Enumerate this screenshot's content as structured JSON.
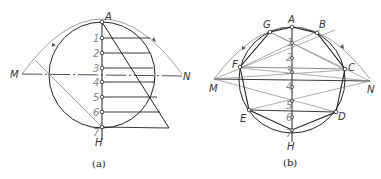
{
  "figure_a": {
    "caption": "(a)",
    "labels": {
      "top": "A",
      "bottom": "H",
      "left": "M",
      "right": "N"
    },
    "divisions": [
      "1",
      "2",
      "3",
      "4",
      "5",
      "6",
      "7"
    ]
  },
  "figure_b": {
    "caption": "(b)",
    "labels": {
      "top": "A",
      "bottom": "H",
      "left": "M",
      "right": "N",
      "vertices": [
        "B",
        "C",
        "D",
        "E",
        "F",
        "G"
      ]
    },
    "divisions": [
      "1",
      "2",
      "3",
      "4",
      "5",
      "6",
      "7"
    ]
  },
  "colors": {
    "line": "#222222",
    "construction": "#888888",
    "label": "#333333"
  }
}
